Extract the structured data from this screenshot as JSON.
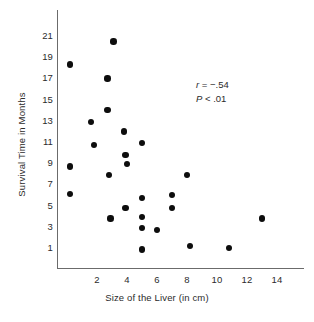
{
  "chart_data": {
    "type": "scatter",
    "title": "",
    "xlabel": "Size of the Liver (in cm)",
    "ylabel": "Survival Time in Months",
    "xlim": [
      0,
      15
    ],
    "ylim": [
      0,
      22
    ],
    "xticks": [
      2,
      4,
      6,
      8,
      10,
      12,
      14
    ],
    "yticks": [
      1,
      3,
      5,
      7,
      9,
      11,
      13,
      15,
      17,
      19,
      21
    ],
    "grid": false,
    "legend": null,
    "annotations": [
      {
        "label": "r",
        "relation": "=",
        "value": "-.54",
        "text": "r = -.54"
      },
      {
        "label": "P",
        "relation": "<",
        "value": ".01",
        "text": "P < .01"
      }
    ],
    "points": [
      {
        "x": 0.2,
        "y": 18.3
      },
      {
        "x": 3.1,
        "y": 20.5
      },
      {
        "x": 2.7,
        "y": 17.0
      },
      {
        "x": 2.7,
        "y": 14.0
      },
      {
        "x": 1.6,
        "y": 12.9
      },
      {
        "x": 3.8,
        "y": 12.0
      },
      {
        "x": 1.8,
        "y": 10.7
      },
      {
        "x": 5.0,
        "y": 10.9
      },
      {
        "x": 3.9,
        "y": 9.8
      },
      {
        "x": 0.2,
        "y": 8.7
      },
      {
        "x": 4.0,
        "y": 8.9
      },
      {
        "x": 2.8,
        "y": 7.9
      },
      {
        "x": 0.2,
        "y": 6.1
      },
      {
        "x": 8.0,
        "y": 7.9
      },
      {
        "x": 5.0,
        "y": 5.7
      },
      {
        "x": 7.0,
        "y": 6.0
      },
      {
        "x": 7.0,
        "y": 4.8
      },
      {
        "x": 3.9,
        "y": 4.8
      },
      {
        "x": 2.9,
        "y": 3.8
      },
      {
        "x": 5.0,
        "y": 3.9
      },
      {
        "x": 5.0,
        "y": 2.9
      },
      {
        "x": 6.0,
        "y": 2.7
      },
      {
        "x": 13.0,
        "y": 3.8
      },
      {
        "x": 8.2,
        "y": 1.2
      },
      {
        "x": 10.8,
        "y": 1.0
      },
      {
        "x": 5.0,
        "y": 0.85
      }
    ]
  }
}
